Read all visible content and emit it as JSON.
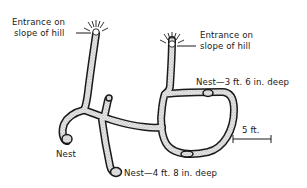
{
  "diagram": {
    "type": "burrow cross-section",
    "labels": {
      "entrance_left_line1": "Entrance on",
      "entrance_left_line2": "slope of hill",
      "entrance_right_line1": "Entrance on",
      "entrance_right_line2": "slope of hill",
      "nest_upper": "Nest—3 ft. 6 in. deep",
      "nest_left": "Nest",
      "nest_lower": "Nest—4 ft. 8 in. deep",
      "scale": "5 ft."
    },
    "colors": {
      "ink": "#1a1a1a",
      "tunnel_fill": "#d8d8d8",
      "background": "#ffffff"
    }
  }
}
